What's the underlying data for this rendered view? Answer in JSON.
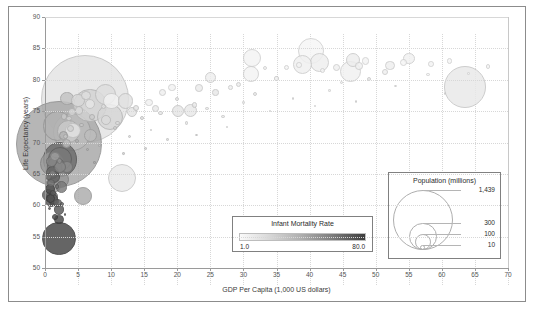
{
  "chart_data": {
    "type": "scatter",
    "title": "",
    "xlabel": "GDP Per Capita (1,000 US dollars)",
    "ylabel": "Life Expectancy (years)",
    "xlim": [
      0,
      70
    ],
    "ylim": [
      50,
      90
    ],
    "xticks": [
      "0",
      "5",
      "10",
      "15",
      "20",
      "25",
      "30",
      "35",
      "40",
      "45",
      "50",
      "55",
      "60",
      "65",
      "70"
    ],
    "yticks": [
      "50",
      "55",
      "60",
      "65",
      "70",
      "75",
      "80",
      "85",
      "90"
    ],
    "grid": true,
    "legend_position": "inside-bottom-right",
    "encoding": {
      "x": "GDP Per Capita (1,000 US dollars)",
      "y": "Life Expectancy (years)",
      "size": "Population (millions)",
      "color": "Infant Mortality Rate"
    },
    "points": [
      {
        "x": 6.1,
        "y": 76.9,
        "pop": 1439,
        "imr": 7.0
      },
      {
        "x": 2.1,
        "y": 69.7,
        "pop": 1380,
        "imr": 30.0
      },
      {
        "x": 4.1,
        "y": 71.7,
        "pop": 273,
        "imr": 21.0
      },
      {
        "x": 2.3,
        "y": 67.3,
        "pop": 221,
        "imr": 56.0
      },
      {
        "x": 2.1,
        "y": 54.7,
        "pop": 206,
        "imr": 74.0
      },
      {
        "x": 6.8,
        "y": 75.9,
        "pop": 212,
        "imr": 13.0
      },
      {
        "x": 1.9,
        "y": 72.6,
        "pop": 165,
        "imr": 25.0
      },
      {
        "x": 2.3,
        "y": 67.4,
        "pop": 109,
        "imr": 50.0
      },
      {
        "x": 63.5,
        "y": 78.9,
        "pop": 331,
        "imr": 5.6
      },
      {
        "x": 40.2,
        "y": 84.6,
        "pop": 126,
        "imr": 1.9
      },
      {
        "x": 11.6,
        "y": 64.4,
        "pop": 146,
        "imr": 5.1
      },
      {
        "x": 9.8,
        "y": 74.1,
        "pop": 128,
        "imr": 12.0
      },
      {
        "x": 1.1,
        "y": 66.6,
        "pop": 115,
        "imr": 35.0
      },
      {
        "x": 3.5,
        "y": 71.8,
        "pop": 98,
        "imr": 16.0
      },
      {
        "x": 46.2,
        "y": 81.3,
        "pop": 84,
        "imr": 3.2
      },
      {
        "x": 9.1,
        "y": 77.7,
        "pop": 84,
        "imr": 9.0
      },
      {
        "x": 1.6,
        "y": 66.2,
        "pop": 60,
        "imr": 48.0
      },
      {
        "x": 2.4,
        "y": 64.1,
        "pop": 54,
        "imr": 37.0
      },
      {
        "x": 41.5,
        "y": 82.7,
        "pop": 68,
        "imr": 3.6
      },
      {
        "x": 39.0,
        "y": 82.5,
        "pop": 67,
        "imr": 3.4
      },
      {
        "x": 31.3,
        "y": 83.4,
        "pop": 60,
        "imr": 2.6
      },
      {
        "x": 5.8,
        "y": 61.5,
        "pop": 59,
        "imr": 28.0
      },
      {
        "x": 10.1,
        "y": 76.6,
        "pop": 52,
        "imr": 2.8
      },
      {
        "x": 31.1,
        "y": 80.9,
        "pop": 47,
        "imr": 2.6
      },
      {
        "x": 12.2,
        "y": 76.6,
        "pop": 45,
        "imr": 8.0
      },
      {
        "x": 4.2,
        "y": 71.9,
        "pop": 45,
        "imr": 7.3
      },
      {
        "x": 1.2,
        "y": 63.1,
        "pop": 44,
        "imr": 36.0
      },
      {
        "x": 46.6,
        "y": 83.2,
        "pop": 38,
        "imr": 4.4
      },
      {
        "x": 3.3,
        "y": 77.0,
        "pop": 34,
        "imr": 19.0
      },
      {
        "x": 22.0,
        "y": 75.1,
        "pop": 34,
        "imr": 5.8
      },
      {
        "x": 1.2,
        "y": 65.2,
        "pop": 32,
        "imr": 58.0
      },
      {
        "x": 5.0,
        "y": 76.7,
        "pop": 33,
        "imr": 11.0
      },
      {
        "x": 6.9,
        "y": 71.1,
        "pop": 32,
        "imr": 21.0
      },
      {
        "x": 1.3,
        "y": 64.5,
        "pop": 31,
        "imr": 60.0
      },
      {
        "x": 0.9,
        "y": 60.8,
        "pop": 30,
        "imr": 68.0
      },
      {
        "x": 3.3,
        "y": 66.1,
        "pop": 29,
        "imr": 41.0
      },
      {
        "x": 2.3,
        "y": 66.1,
        "pop": 29,
        "imr": 43.0
      },
      {
        "x": 0.5,
        "y": 61.6,
        "pop": 26,
        "imr": 62.0
      },
      {
        "x": 20.1,
        "y": 75.0,
        "pop": 26,
        "imr": 6.5
      },
      {
        "x": 55.0,
        "y": 83.4,
        "pop": 25,
        "imr": 3.1
      },
      {
        "x": 1.1,
        "y": 61.4,
        "pop": 25,
        "imr": 55.0
      },
      {
        "x": 1.0,
        "y": 67.0,
        "pop": 25,
        "imr": 44.0
      },
      {
        "x": 2.5,
        "y": 62.9,
        "pop": 24,
        "imr": 49.0
      },
      {
        "x": 25.0,
        "y": 80.4,
        "pop": 24,
        "imr": 4.0
      },
      {
        "x": 2.1,
        "y": 59.3,
        "pop": 20,
        "imr": 65.0
      },
      {
        "x": 0.8,
        "y": 62.6,
        "pop": 20,
        "imr": 70.0
      },
      {
        "x": 6.8,
        "y": 76.1,
        "pop": 19,
        "imr": 6.5
      },
      {
        "x": 1.1,
        "y": 61.2,
        "pop": 19,
        "imr": 64.0
      },
      {
        "x": 13.1,
        "y": 74.8,
        "pop": 19,
        "imr": 7.2
      },
      {
        "x": 1.3,
        "y": 60.6,
        "pop": 18,
        "imr": 66.0
      },
      {
        "x": 9.2,
        "y": 73.6,
        "pop": 18,
        "imr": 10.0
      },
      {
        "x": 52.2,
        "y": 82.3,
        "pop": 17,
        "imr": 3.6
      },
      {
        "x": 2.1,
        "y": 57.7,
        "pop": 17,
        "imr": 72.0
      },
      {
        "x": 1.5,
        "y": 67.8,
        "pop": 17,
        "imr": 34.0
      },
      {
        "x": 6.2,
        "y": 77.5,
        "pop": 17,
        "imr": 9.0
      },
      {
        "x": 2.8,
        "y": 71.1,
        "pop": 16,
        "imr": 25.0
      },
      {
        "x": 3.3,
        "y": 69.8,
        "pop": 16,
        "imr": 22.0
      },
      {
        "x": 1.2,
        "y": 61.0,
        "pop": 16,
        "imr": 60.0
      },
      {
        "x": 0.8,
        "y": 61.1,
        "pop": 16,
        "imr": 69.0
      },
      {
        "x": 5.1,
        "y": 75.1,
        "pop": 13,
        "imr": 11.0
      },
      {
        "x": 1.9,
        "y": 60.4,
        "pop": 13,
        "imr": 59.0
      },
      {
        "x": 4.1,
        "y": 74.9,
        "pop": 11,
        "imr": 12.0
      },
      {
        "x": 47.5,
        "y": 82.2,
        "pop": 11,
        "imr": 3.3
      },
      {
        "x": 0.9,
        "y": 63.6,
        "pop": 12,
        "imr": 52.0
      },
      {
        "x": 23.3,
        "y": 78.7,
        "pop": 11,
        "imr": 5.0
      },
      {
        "x": 44.1,
        "y": 81.9,
        "pop": 10,
        "imr": 3.5
      },
      {
        "x": 15.7,
        "y": 76.4,
        "pop": 10,
        "imr": 3.0
      },
      {
        "x": 19.2,
        "y": 78.8,
        "pop": 10,
        "imr": 2.8
      },
      {
        "x": 16.7,
        "y": 75.4,
        "pop": 10,
        "imr": 5.6
      },
      {
        "x": 48.5,
        "y": 83.0,
        "pop": 10,
        "imr": 2.4
      },
      {
        "x": 17.8,
        "y": 78.0,
        "pop": 9,
        "imr": 4.1
      },
      {
        "x": 0.5,
        "y": 64.6,
        "pop": 9,
        "imr": 51.0
      },
      {
        "x": 54.2,
        "y": 82.8,
        "pop": 9,
        "imr": 2.1
      },
      {
        "x": 1.1,
        "y": 65.1,
        "pop": 9,
        "imr": 45.0
      },
      {
        "x": 3.9,
        "y": 72.3,
        "pop": 9,
        "imr": 14.0
      },
      {
        "x": 51.4,
        "y": 81.2,
        "pop": 8,
        "imr": 3.5
      },
      {
        "x": 87.0,
        "y": 83.8,
        "pop": 8,
        "imr": 3.6
      },
      {
        "x": 2.9,
        "y": 74.1,
        "pop": 8,
        "imr": 16.0
      },
      {
        "x": 25.8,
        "y": 78.0,
        "pop": 8,
        "imr": 6.0
      },
      {
        "x": 7.1,
        "y": 74.0,
        "pop": 7,
        "imr": 15.0
      },
      {
        "x": 1.5,
        "y": 58.1,
        "pop": 7,
        "imr": 71.0
      },
      {
        "x": 13.8,
        "y": 75.5,
        "pop": 7,
        "imr": 7.5
      },
      {
        "x": 22.6,
        "y": 76.0,
        "pop": 6,
        "imr": 6.0
      },
      {
        "x": 3.6,
        "y": 73.8,
        "pop": 6,
        "imr": 13.0
      },
      {
        "x": 58.4,
        "y": 82.5,
        "pop": 6,
        "imr": 2.3
      },
      {
        "x": 38.4,
        "y": 82.3,
        "pop": 6,
        "imr": 2.5
      },
      {
        "x": 2.2,
        "y": 67.1,
        "pop": 6,
        "imr": 39.0
      },
      {
        "x": 1.2,
        "y": 62.0,
        "pop": 6,
        "imr": 63.0
      },
      {
        "x": 3.1,
        "y": 71.0,
        "pop": 5,
        "imr": 18.0
      },
      {
        "x": 36.5,
        "y": 82.0,
        "pop": 5,
        "imr": 2.5
      },
      {
        "x": 61.2,
        "y": 83.0,
        "pop": 5,
        "imr": 2.0
      },
      {
        "x": 8.9,
        "y": 75.7,
        "pop": 5,
        "imr": 8.0
      },
      {
        "x": 41.9,
        "y": 81.5,
        "pop": 5,
        "imr": 2.2
      },
      {
        "x": 29.2,
        "y": 79.3,
        "pop": 5,
        "imr": 4.5
      },
      {
        "x": 17.5,
        "y": 74.7,
        "pop": 4,
        "imr": 6.0
      },
      {
        "x": 49.0,
        "y": 80.1,
        "pop": 4,
        "imr": 4.8
      },
      {
        "x": 11.0,
        "y": 73.1,
        "pop": 4,
        "imr": 9.5
      },
      {
        "x": 67.0,
        "y": 82.1,
        "pop": 4,
        "imr": 2.0
      },
      {
        "x": 28.0,
        "y": 78.8,
        "pop": 4,
        "imr": 3.9
      },
      {
        "x": 1.8,
        "y": 63.0,
        "pop": 4,
        "imr": 53.0
      },
      {
        "x": 5.5,
        "y": 72.8,
        "pop": 4,
        "imr": 17.0
      },
      {
        "x": 10.6,
        "y": 72.3,
        "pop": 3,
        "imr": 12.0
      },
      {
        "x": 33.2,
        "y": 81.8,
        "pop": 3,
        "imr": 2.8
      },
      {
        "x": 2.6,
        "y": 60.2,
        "pop": 3,
        "imr": 57.0
      },
      {
        "x": 19.9,
        "y": 77.0,
        "pop": 3,
        "imr": 5.5
      },
      {
        "x": 4.8,
        "y": 70.2,
        "pop": 3,
        "imr": 23.0
      },
      {
        "x": 31.8,
        "y": 77.8,
        "pop": 3,
        "imr": 5.0
      },
      {
        "x": 35.0,
        "y": 80.2,
        "pop": 3,
        "imr": 4.0
      },
      {
        "x": 14.6,
        "y": 73.9,
        "pop": 3,
        "imr": 8.5
      },
      {
        "x": 44.8,
        "y": 79.6,
        "pop": 2,
        "imr": 4.2
      },
      {
        "x": 24.5,
        "y": 75.4,
        "pop": 2,
        "imr": 6.3
      },
      {
        "x": 6.4,
        "y": 68.9,
        "pop": 2,
        "imr": 26.0
      },
      {
        "x": 0.7,
        "y": 59.5,
        "pop": 2,
        "imr": 67.0
      },
      {
        "x": 21.4,
        "y": 73.1,
        "pop": 2,
        "imr": 7.0
      },
      {
        "x": 57.9,
        "y": 80.8,
        "pop": 2,
        "imr": 2.7
      },
      {
        "x": 26.9,
        "y": 74.2,
        "pop": 2,
        "imr": 6.8
      },
      {
        "x": 12.8,
        "y": 71.0,
        "pop": 2,
        "imr": 11.0
      },
      {
        "x": 43.0,
        "y": 78.3,
        "pop": 1,
        "imr": 5.0
      },
      {
        "x": 30.0,
        "y": 76.4,
        "pop": 1,
        "imr": 5.5
      },
      {
        "x": 8.2,
        "y": 69.5,
        "pop": 1,
        "imr": 19.0
      },
      {
        "x": 16.0,
        "y": 72.0,
        "pop": 1,
        "imr": 9.0
      },
      {
        "x": 37.5,
        "y": 77.0,
        "pop": 1,
        "imr": 4.5
      },
      {
        "x": 53.0,
        "y": 79.0,
        "pop": 1,
        "imr": 3.8
      },
      {
        "x": 3.0,
        "y": 58.5,
        "pop": 1,
        "imr": 61.0
      },
      {
        "x": 18.5,
        "y": 70.5,
        "pop": 1,
        "imr": 10.5
      },
      {
        "x": 27.5,
        "y": 72.5,
        "pop": 1,
        "imr": 7.5
      },
      {
        "x": 64.0,
        "y": 81.0,
        "pop": 1,
        "imr": 3.0
      },
      {
        "x": 34.0,
        "y": 75.0,
        "pop": 1,
        "imr": 6.0
      },
      {
        "x": 47.0,
        "y": 76.5,
        "pop": 1,
        "imr": 5.2
      },
      {
        "x": 7.5,
        "y": 66.8,
        "pop": 1,
        "imr": 29.0
      },
      {
        "x": 11.9,
        "y": 68.2,
        "pop": 1,
        "imr": 15.5
      },
      {
        "x": 40.8,
        "y": 75.8,
        "pop": 1,
        "imr": 5.8
      },
      {
        "x": 22.9,
        "y": 71.2,
        "pop": 1,
        "imr": 8.8
      },
      {
        "x": 60.5,
        "y": 77.8,
        "pop": 1,
        "imr": 4.0
      },
      {
        "x": 15.2,
        "y": 69.0,
        "pop": 1,
        "imr": 13.0
      }
    ]
  },
  "color_legend": {
    "title": "Infant Mortality Rate",
    "min_label": "1.0",
    "max_label": "80.0",
    "min_color": "#fafafa",
    "max_color": "#3c3c3c"
  },
  "size_legend": {
    "title": "Population (millions)",
    "entries": [
      {
        "label": "1,439",
        "value": 1439
      },
      {
        "label": "300",
        "value": 300
      },
      {
        "label": "100",
        "value": 100
      },
      {
        "label": "10",
        "value": 10
      }
    ]
  }
}
